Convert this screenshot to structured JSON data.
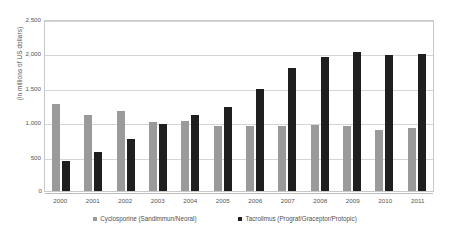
{
  "chart_data": {
    "type": "bar",
    "title": "",
    "subtitle": "",
    "xlabel": "",
    "ylabel": "(in millions of US dollars)",
    "categories": [
      "2000",
      "2001",
      "2002",
      "2003",
      "2004",
      "2005",
      "2006",
      "2007",
      "2008",
      "2009",
      "2010",
      "2011"
    ],
    "series": [
      {
        "name": "Cyclosporine (Sandimmun/Neoral)",
        "color": "#9a9a9a",
        "values": [
          1270,
          1100,
          1160,
          1000,
          1020,
          950,
          940,
          950,
          960,
          940,
          880,
          910
        ]
      },
      {
        "name": "Tacrolimus (Prograf/Graceptor/Protopic)",
        "color": "#1f1f1f",
        "values": [
          440,
          560,
          760,
          980,
          1110,
          1220,
          1480,
          1790,
          1950,
          2020,
          1980,
          1990
        ]
      }
    ],
    "ylim": [
      0,
      2500
    ],
    "yticks": [
      0,
      500,
      1000,
      1500,
      2000,
      2500
    ],
    "ytick_labels": [
      "0",
      "500",
      "1,000",
      "1,500",
      "2,000",
      "2,500"
    ],
    "grid": true,
    "legend_position": "bottom"
  },
  "axis": {
    "y_title": "(in millions of US dollars)",
    "zero_label": "0"
  },
  "legend": {
    "items": [
      {
        "label": "Cyclosporine (Sandimmun/Neoral)",
        "color": "#9a9a9a"
      },
      {
        "label": "Tacrolimus (Prograf/Graceptor/Protopic)",
        "color": "#1f1f1f"
      }
    ]
  }
}
